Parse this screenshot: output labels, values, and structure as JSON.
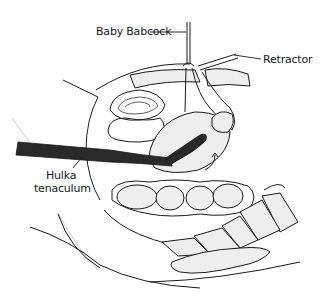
{
  "figure": {
    "type": "anatomical line drawing",
    "labels": [
      {
        "id": "baby-babcock",
        "text": "Baby Babcock",
        "x": 96,
        "y": 29
      },
      {
        "id": "retractor",
        "text": "Retractor",
        "x": 263,
        "y": 56
      },
      {
        "id": "hulka-line1",
        "text": "Hulka",
        "x": 46,
        "y": 172
      },
      {
        "id": "hulka-line2",
        "text": "tenaculum",
        "x": 34,
        "y": 185
      }
    ],
    "colors": {
      "line": "#1a1a1a",
      "fill_stipple": "#eeeeee",
      "instrument": "#2a2a2a",
      "background": "#ffffff"
    }
  }
}
